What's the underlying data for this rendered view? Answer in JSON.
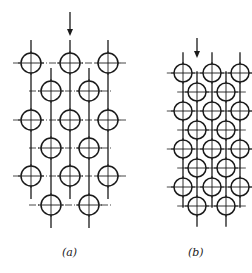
{
  "figure": {
    "colors": {
      "stroke": "#1a1a1a",
      "background": "#ffffff"
    },
    "panels": [
      {
        "id": "a",
        "label": "(a)",
        "description": "Staggered tube bank, wide spacing, flow arrow downward",
        "radius": 10,
        "arrow": {
          "x": 70,
          "y1": 12,
          "y2": 36
        },
        "outer_columns_x": [
          31,
          70,
          108
        ],
        "outer_rows_y": [
          63,
          120,
          176
        ],
        "inner_columns_x": [
          51,
          89
        ],
        "inner_rows_y": [
          91,
          148,
          205
        ]
      },
      {
        "id": "b",
        "label": "(b)",
        "description": "Staggered tube bank, compact spacing, flow arrow downward",
        "radius": 9,
        "arrow": {
          "x": 197,
          "y1": 38,
          "y2": 58
        },
        "outer_columns_x": [
          183,
          212,
          240
        ],
        "outer_rows_y": [
          73,
          111,
          149,
          187
        ],
        "inner_columns_x": [
          197,
          226
        ],
        "inner_rows_y": [
          92,
          130,
          168,
          206
        ]
      }
    ]
  }
}
